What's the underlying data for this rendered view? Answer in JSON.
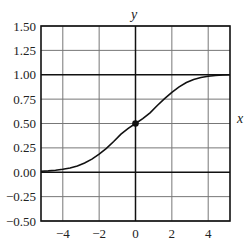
{
  "chart_data": {
    "type": "line",
    "title": "",
    "xlabel": "x",
    "ylabel": "y",
    "xlim": [
      -5.2,
      5.2
    ],
    "ylim": [
      -0.5,
      1.5
    ],
    "grid": true,
    "x_ticks": [
      -4,
      -2,
      0,
      2,
      4
    ],
    "x_tick_labels": [
      "−4",
      "−2",
      "0",
      "2",
      "4"
    ],
    "y_ticks": [
      1.5,
      1.25,
      1.0,
      0.75,
      0.5,
      0.25,
      0.0,
      -0.25,
      -0.5
    ],
    "y_tick_labels": [
      "1.50",
      "1.25",
      "1.00",
      "0.75",
      "0.50",
      "0.25",
      "0.00",
      "−0.25",
      "−0.50"
    ],
    "emphasized_hlines": [
      0.0,
      1.0
    ],
    "series": [
      {
        "name": "sigmoid curve",
        "x": [
          -5.2,
          -4.8,
          -4.4,
          -4.0,
          -3.6,
          -3.2,
          -2.8,
          -2.4,
          -2.0,
          -1.6,
          -1.2,
          -0.8,
          -0.4,
          0.0,
          0.4,
          0.8,
          1.2,
          1.6,
          2.0,
          2.4,
          2.8,
          3.2,
          3.6,
          4.0,
          4.4,
          4.8,
          5.2
        ],
        "values": [
          0.01,
          0.014,
          0.021,
          0.03,
          0.044,
          0.065,
          0.095,
          0.135,
          0.185,
          0.245,
          0.315,
          0.39,
          0.45,
          0.5,
          0.55,
          0.61,
          0.685,
          0.755,
          0.82,
          0.875,
          0.92,
          0.952,
          0.972,
          0.984,
          0.992,
          0.997,
          1.0
        ],
        "color": "#111111"
      }
    ],
    "points": [
      {
        "x": 0,
        "y": 0.5,
        "label": ""
      }
    ]
  }
}
